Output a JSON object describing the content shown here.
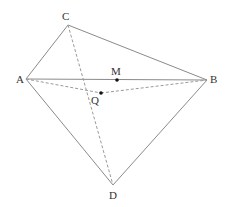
{
  "diagram": {
    "type": "geometry-figure",
    "points": {
      "A": {
        "label": "A",
        "x": 26,
        "y": 79,
        "lx": 16,
        "ly": 83
      },
      "B": {
        "label": "B",
        "x": 207,
        "y": 80,
        "lx": 210,
        "ly": 83
      },
      "C": {
        "label": "C",
        "x": 68,
        "y": 25,
        "lx": 62,
        "ly": 20
      },
      "D": {
        "label": "D",
        "x": 113,
        "y": 185,
        "lx": 109,
        "ly": 199
      },
      "M": {
        "label": "M",
        "x": 117,
        "y": 80,
        "lx": 111,
        "ly": 75
      },
      "Q": {
        "label": "Q",
        "x": 101,
        "y": 93,
        "lx": 91,
        "ly": 104
      }
    },
    "solid_segments": [
      [
        "A",
        "C"
      ],
      [
        "C",
        "B"
      ],
      [
        "A",
        "B"
      ],
      [
        "A",
        "D"
      ],
      [
        "B",
        "D"
      ]
    ],
    "dashed_segments": [
      [
        "C",
        "D"
      ],
      [
        "A",
        "Q"
      ],
      [
        "Q",
        "B"
      ]
    ],
    "marked_points": [
      "M",
      "Q"
    ],
    "colors": {
      "line": "#8a8a8a",
      "dashed": "#9a9a9a",
      "point": "#111111",
      "label": "#333333"
    }
  }
}
